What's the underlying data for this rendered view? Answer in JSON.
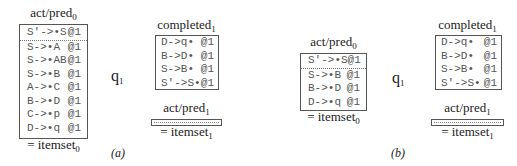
{
  "panels": [
    {
      "id": "a",
      "caption": "(a)",
      "left_box": {
        "title": "act/pred",
        "title_sub": "0",
        "footer": "= itemset",
        "footer_sub": "0",
        "rows": [
          {
            "item": "S′->•S",
            "origin": "@1"
          },
          {
            "item": "S->•A",
            "origin": "@1"
          },
          {
            "item": "S->•AB",
            "origin": "@1"
          },
          {
            "item": "S->•B",
            "origin": "@1"
          },
          {
            "item": "A->•C",
            "origin": "@1"
          },
          {
            "item": "B->•D",
            "origin": "@1"
          },
          {
            "item": "C->•p",
            "origin": "@1"
          },
          {
            "item": "D->•q",
            "origin": "@1"
          }
        ]
      },
      "transition": {
        "symbol": "q",
        "symbol_sub": "1"
      },
      "completed_box": {
        "title": "completed",
        "title_sub": "1",
        "rows": [
          {
            "item": "D->q•",
            "origin": "@1"
          },
          {
            "item": "B->D•",
            "origin": "@1"
          },
          {
            "item": "S->B•",
            "origin": "@1"
          },
          {
            "item": "S′->S•",
            "origin": "@1"
          }
        ]
      },
      "next_box": {
        "title": "act/pred",
        "title_sub": "1",
        "footer": "= itemset",
        "footer_sub": "1"
      }
    },
    {
      "id": "b",
      "caption": "(b)",
      "left_box": {
        "title": "act/pred",
        "title_sub": "0",
        "footer": "= itemset",
        "footer_sub": "0",
        "rows": [
          {
            "item": "S′->•S",
            "origin": "@1"
          },
          {
            "item": "S->•B",
            "origin": "@1"
          },
          {
            "item": "B->•D",
            "origin": "@1"
          },
          {
            "item": "D->•q",
            "origin": "@1"
          }
        ]
      },
      "transition": {
        "symbol": "q",
        "symbol_sub": "1"
      },
      "completed_box": {
        "title": "completed",
        "title_sub": "1",
        "rows": [
          {
            "item": "D->q•",
            "origin": "@1"
          },
          {
            "item": "B->D•",
            "origin": "@1"
          },
          {
            "item": "S->B•",
            "origin": "@1"
          },
          {
            "item": "S′->S•",
            "origin": "@1"
          }
        ]
      },
      "next_box": {
        "title": "act/pred",
        "title_sub": "1",
        "footer": "= itemset",
        "footer_sub": "1"
      }
    }
  ]
}
